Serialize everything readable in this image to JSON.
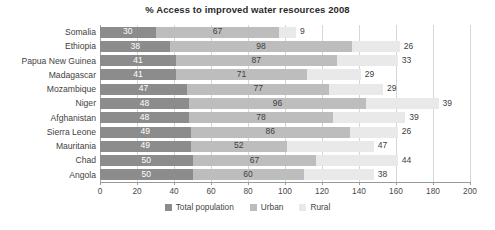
{
  "chart_data": {
    "type": "bar",
    "orientation": "horizontal",
    "stacked": true,
    "title": "% Access to improved water resources 2008",
    "xlabel": "",
    "ylabel": "",
    "xlim": [
      0,
      200
    ],
    "xticks": [
      "0",
      "20",
      "40",
      "60",
      "80",
      "100",
      "120",
      "140",
      "160",
      "180",
      "200"
    ],
    "grid": true,
    "legend_position": "bottom",
    "categories": [
      "Somalia",
      "Ethiopia",
      "Papua New Guinea",
      "Madagascar",
      "Mozambique",
      "Niger",
      "Afghanistan",
      "Sierra Leone",
      "Mauritania",
      "Chad",
      "Angola"
    ],
    "series": [
      {
        "name": "Total population",
        "color": "#8c8c8c",
        "values": [
          30,
          38,
          41,
          41,
          47,
          48,
          48,
          49,
          49,
          50,
          50
        ]
      },
      {
        "name": "Urban",
        "color": "#bdbdbd",
        "values": [
          67,
          98,
          87,
          71,
          77,
          96,
          78,
          86,
          52,
          67,
          60
        ]
      },
      {
        "name": "Rural",
        "color": "#e9e9e9",
        "values": [
          9,
          26,
          33,
          29,
          29,
          39,
          39,
          26,
          47,
          44,
          38
        ]
      }
    ]
  },
  "legend": {
    "items": [
      {
        "label": "Total population",
        "color": "#8c8c8c"
      },
      {
        "label": "Urban",
        "color": "#bdbdbd"
      },
      {
        "label": "Rural",
        "color": "#e9e9e9"
      }
    ]
  }
}
